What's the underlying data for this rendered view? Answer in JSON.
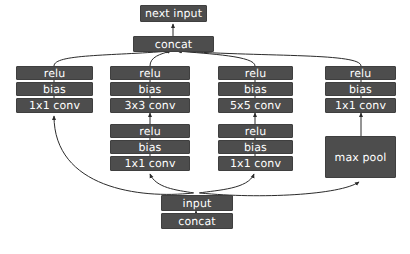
{
  "diagram": {
    "type": "neural-network-block-diagram",
    "colors": {
      "node_fill": "#4d4d4d",
      "node_text": "#ffffff",
      "edge": "#2b2b2b",
      "background": "#ffffff"
    },
    "top": {
      "next_input": "next input",
      "concat": "concat"
    },
    "bottom": {
      "input": "input",
      "concat": "concat"
    },
    "branches": [
      {
        "id": "branch-1",
        "upper": [
          "relu",
          "bias",
          "1x1 conv"
        ],
        "lower": []
      },
      {
        "id": "branch-2",
        "upper": [
          "relu",
          "bias",
          "3x3 conv"
        ],
        "lower": [
          "relu",
          "bias",
          "1x1 conv"
        ]
      },
      {
        "id": "branch-3",
        "upper": [
          "relu",
          "bias",
          "5x5 conv"
        ],
        "lower": [
          "relu",
          "bias",
          "1x1 conv"
        ]
      },
      {
        "id": "branch-4",
        "upper": [
          "relu",
          "bias",
          "1x1 conv"
        ],
        "lower": [
          "max pool"
        ]
      }
    ]
  }
}
